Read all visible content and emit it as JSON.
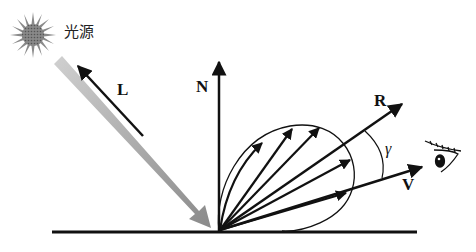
{
  "diagram": {
    "light_source_label": "光源",
    "vectors": {
      "L": "L",
      "N": "N",
      "R": "R",
      "V": "V"
    },
    "angle_label": "γ",
    "elements": [
      "light-source",
      "incident-light-ray",
      "light-vector-L",
      "normal-vector-N",
      "reflection-vector-R",
      "view-vector-V",
      "specular-lobe",
      "surface",
      "eye"
    ],
    "colors": {
      "stroke": "#111111",
      "incident_ray": "#9a9a9a",
      "sun": "#6e6e6e"
    }
  }
}
